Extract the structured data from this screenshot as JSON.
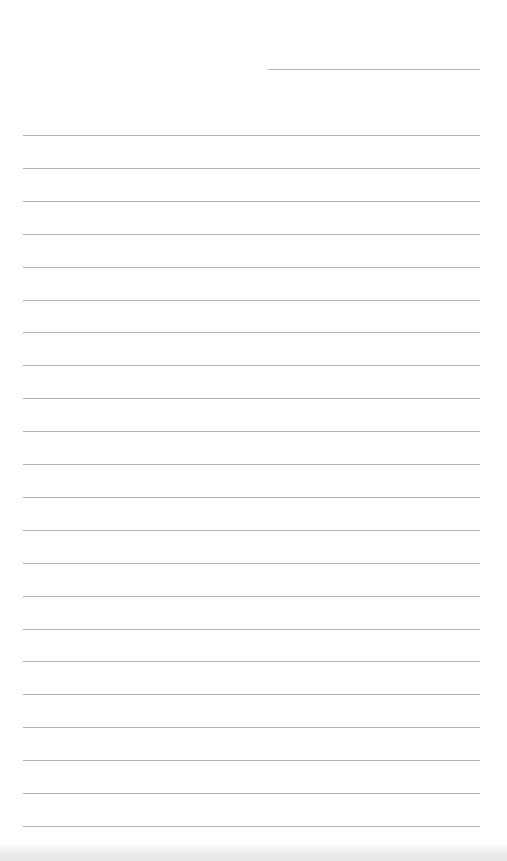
{
  "document": {
    "type": "lined-paper",
    "background_color": "#ffffff",
    "rule_color": "#b4b4b4",
    "header_rule": {
      "x1": 268,
      "x2": 480,
      "y": 69
    },
    "body_rules": {
      "x1": 23,
      "x2": 480,
      "ys": [
        135,
        168,
        201,
        234,
        267,
        300,
        332,
        365,
        398,
        431,
        464,
        497,
        530,
        563,
        596,
        629,
        661,
        694,
        727,
        760,
        793,
        826
      ]
    }
  }
}
